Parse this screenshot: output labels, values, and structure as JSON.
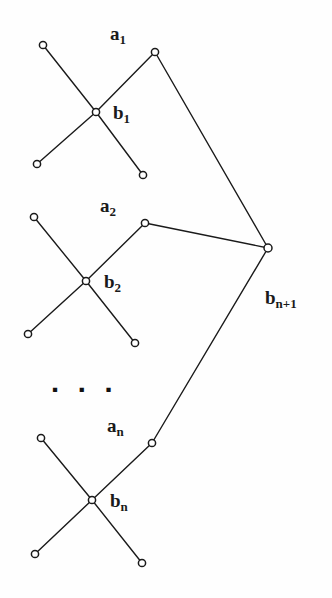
{
  "figure": {
    "background_color": "#fefefe",
    "stroke_color": "#1a1a1a",
    "node_fill_color": "#ffffff",
    "label_color": "#1a1a1a",
    "ellipsis": "▪ ▪ ▪"
  },
  "labels": [
    {
      "id": "a1",
      "base": "a",
      "sub": "1",
      "x": 110,
      "y": 24
    },
    {
      "id": "b1",
      "base": "b",
      "sub": "1",
      "x": 113,
      "y": 103
    },
    {
      "id": "a2",
      "base": "a",
      "sub": "2",
      "x": 100,
      "y": 196
    },
    {
      "id": "b2",
      "base": "b",
      "sub": "2",
      "x": 104,
      "y": 272
    },
    {
      "id": "an",
      "base": "a",
      "sub": "n",
      "x": 107,
      "y": 416
    },
    {
      "id": "bn",
      "base": "b",
      "sub": "n",
      "x": 110,
      "y": 491
    },
    {
      "id": "bn1",
      "base": "b",
      "sub": "n+1",
      "x": 265,
      "y": 288
    }
  ],
  "ellipsis_position": {
    "x": 52,
    "y": 381
  },
  "nodes": [
    {
      "id": "c1-nw",
      "x": 43,
      "y": 45,
      "r": 3.6
    },
    {
      "id": "c1-b",
      "x": 96,
      "y": 112,
      "r": 3.6
    },
    {
      "id": "c1-sw",
      "x": 37,
      "y": 164,
      "r": 3.6
    },
    {
      "id": "c1-se",
      "x": 143,
      "y": 175,
      "r": 3.6
    },
    {
      "id": "c1-a",
      "x": 155,
      "y": 52,
      "r": 3.6
    },
    {
      "id": "c2-nw",
      "x": 34,
      "y": 217,
      "r": 3.6
    },
    {
      "id": "c2-b",
      "x": 86,
      "y": 281,
      "r": 3.6
    },
    {
      "id": "c2-sw",
      "x": 28,
      "y": 334,
      "r": 3.6
    },
    {
      "id": "c2-se",
      "x": 135,
      "y": 343,
      "r": 3.6
    },
    {
      "id": "c2-a",
      "x": 145,
      "y": 223,
      "r": 3.6
    },
    {
      "id": "c3-nw",
      "x": 41,
      "y": 438,
      "r": 3.6
    },
    {
      "id": "c3-b",
      "x": 92,
      "y": 500,
      "r": 3.6
    },
    {
      "id": "c3-sw",
      "x": 35,
      "y": 554,
      "r": 3.6
    },
    {
      "id": "c3-se",
      "x": 142,
      "y": 563,
      "r": 3.6
    },
    {
      "id": "c3-a",
      "x": 152,
      "y": 443,
      "r": 3.6
    },
    {
      "id": "hub",
      "x": 268,
      "y": 248,
      "r": 4.0
    }
  ],
  "edges": [
    {
      "id": "e-c1-nw-b",
      "from": "c1-nw",
      "to": "c1-b"
    },
    {
      "id": "e-c1-b-sw",
      "from": "c1-b",
      "to": "c1-sw"
    },
    {
      "id": "e-c1-b-se",
      "from": "c1-b",
      "to": "c1-se"
    },
    {
      "id": "e-c1-b-a",
      "from": "c1-b",
      "to": "c1-a"
    },
    {
      "id": "e-c1-a-hub",
      "from": "c1-a",
      "to": "hub"
    },
    {
      "id": "e-c2-nw-b",
      "from": "c2-nw",
      "to": "c2-b"
    },
    {
      "id": "e-c2-b-sw",
      "from": "c2-b",
      "to": "c2-sw"
    },
    {
      "id": "e-c2-b-se",
      "from": "c2-b",
      "to": "c2-se"
    },
    {
      "id": "e-c2-b-a",
      "from": "c2-b",
      "to": "c2-a"
    },
    {
      "id": "e-c2-a-hub",
      "from": "c2-a",
      "to": "hub"
    },
    {
      "id": "e-c3-nw-b",
      "from": "c3-nw",
      "to": "c3-b"
    },
    {
      "id": "e-c3-b-sw",
      "from": "c3-b",
      "to": "c3-sw"
    },
    {
      "id": "e-c3-b-se",
      "from": "c3-b",
      "to": "c3-se"
    },
    {
      "id": "e-c3-b-a",
      "from": "c3-b",
      "to": "c3-a"
    },
    {
      "id": "e-c3-a-hub",
      "from": "c3-a",
      "to": "hub"
    }
  ]
}
